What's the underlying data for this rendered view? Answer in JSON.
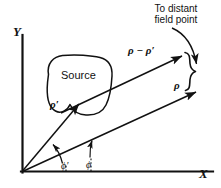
{
  "figure": {
    "background_color": "#ffffff",
    "ink_color": "#111111",
    "width": 221,
    "height": 188
  },
  "axes": {
    "y_label": "Y",
    "x_label": "X"
  },
  "source_region": {
    "label": "Source"
  },
  "vectors": [
    {
      "name": "rho-prime",
      "label": "ρ′",
      "description": "vector from origin to point inside source"
    },
    {
      "name": "rho",
      "label": "ρ",
      "description": "vector from origin to distant field point"
    },
    {
      "name": "rho-minus-rho-prime",
      "label": "ρ − ρ′",
      "description": "vector from source point to distant field point"
    }
  ],
  "angles": [
    {
      "name": "phi-prime",
      "label": "ϕ′",
      "description": "angle of rho-prime from X axis"
    },
    {
      "name": "phi",
      "label": "ϕ",
      "description": "angle of rho from X axis"
    }
  ],
  "annotation": {
    "text": "To distant\nfield point"
  }
}
